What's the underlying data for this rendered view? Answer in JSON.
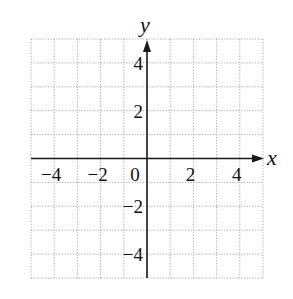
{
  "chart_data": {
    "type": "scatter",
    "title": "",
    "xlabel": "x",
    "ylabel": "y",
    "xlim": [
      -5,
      5
    ],
    "ylim": [
      -5,
      5
    ],
    "grid": true,
    "grid_style": "dotted",
    "grid_step": 1,
    "x_ticks": [
      -4,
      -2,
      0,
      2,
      4
    ],
    "x_tick_labels": [
      "−4",
      "−2",
      "0",
      "2",
      "4"
    ],
    "y_ticks": [
      4,
      2,
      -2,
      -4
    ],
    "y_tick_labels": [
      "4",
      "2",
      "−2",
      "−4"
    ],
    "series": [],
    "legend": null
  },
  "colors": {
    "axis": "#1a1a1a",
    "grid": "#a8a8a8",
    "text": "#111111",
    "background": "#ffffff"
  }
}
